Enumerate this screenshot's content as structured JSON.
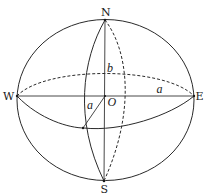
{
  "diagram": {
    "type": "ellipsoid-of-revolution",
    "colors": {
      "line": "#2a2a2a",
      "background": "#ffffff"
    },
    "points": {
      "north": {
        "label": "N"
      },
      "south": {
        "label": "S"
      },
      "west": {
        "label": "W"
      },
      "east": {
        "label": "E"
      },
      "center": {
        "label": "O"
      }
    },
    "segments": {
      "semi_major_horizontal": {
        "label": "a"
      },
      "semi_minor_vertical": {
        "label": "b"
      },
      "semi_major_oblique": {
        "label": "a"
      }
    },
    "elements": [
      "outer-ellipse-outline",
      "front-meridian-solid",
      "back-meridian-dashed",
      "front-equator-solid",
      "back-equator-dashed",
      "polar-axis-NS",
      "equatorial-axis-WE",
      "oblique-radius-a"
    ]
  }
}
